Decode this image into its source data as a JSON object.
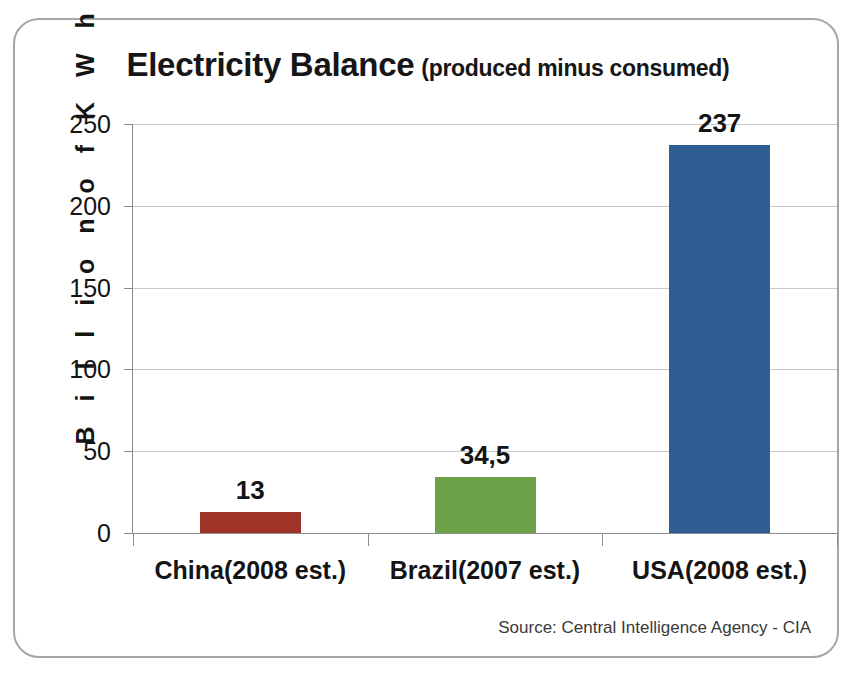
{
  "card": {
    "source_note": "Source: Central Intelligence Agency - CIA"
  },
  "chart_data": {
    "type": "bar",
    "title": "Electricity Balance",
    "subtitle": "(produced minus consumed)",
    "xlabel": "",
    "ylabel": "B i l l i o n   o f   K W h",
    "categories": [
      "China(2008 est.)",
      "Brazil(2007 est.)",
      "USA(2008 est.)"
    ],
    "values": [
      13,
      34.5,
      237
    ],
    "value_labels": [
      "13",
      "34,5",
      "237"
    ],
    "series": [
      {
        "name": "Electricity Balance",
        "values": [
          13,
          34.5,
          237
        ]
      }
    ],
    "bar_colors": [
      "#9E3328",
      "#6CA14A",
      "#2F5E92"
    ],
    "ylim": [
      0,
      250
    ],
    "yticks": [
      0,
      50,
      100,
      150,
      200,
      250
    ],
    "ytick_labels": [
      "0",
      "50",
      "100",
      "150",
      "200",
      "250"
    ],
    "grid": true,
    "legend": "none",
    "source": "Source: Central Intelligence Agency - CIA"
  },
  "colors": {
    "china_bar": "#9E3328",
    "brazil_bar": "#6CA14A",
    "usa_bar": "#2F5E92",
    "gridline": "#c9c9c9",
    "axis": "#8c8c8c",
    "card_border": "#a6a6a6",
    "text": "#141414"
  }
}
